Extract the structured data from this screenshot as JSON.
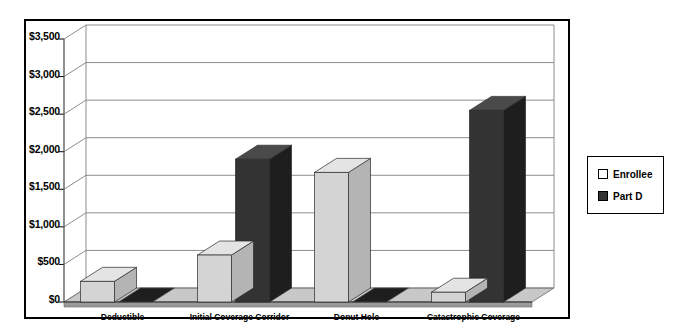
{
  "chart_data": {
    "type": "bar",
    "title": "",
    "subtitle": "",
    "xlabel": "",
    "ylabel": "",
    "categories": [
      "Deductible",
      "Initial Coverage Corridor",
      "Donut Hole",
      "Catastrophic Coverage"
    ],
    "series": [
      {
        "name": "Enrollee",
        "values": [
          275,
          625,
          1725,
          130
        ],
        "color": "#d4d4d4"
      },
      {
        "name": "Part D",
        "values": [
          0,
          1900,
          0,
          2550
        ],
        "color": "#333333"
      }
    ],
    "ylim": [
      0,
      3500
    ],
    "ytick_values": [
      0,
      500,
      1000,
      1500,
      2000,
      2500,
      3000,
      3500
    ],
    "ytick_labels": [
      "$0",
      "$500",
      "$1,000",
      "$1,500",
      "$2,000",
      "$2,500",
      "$3,000",
      "$3,500"
    ],
    "grid": true,
    "grid_axis": "y",
    "legend_position": "right",
    "style": "3d-clustered-column"
  },
  "legend": {
    "items": [
      {
        "label": "Enrollee",
        "swatch": "#ffffff"
      },
      {
        "label": "Part D",
        "swatch": "#333333"
      }
    ]
  },
  "colors": {
    "enrollee_front": "#d4d4d4",
    "enrollee_top": "#e4e4e4",
    "enrollee_side": "#b4b4b4",
    "partd_front": "#333333",
    "partd_top": "#4a4a4a",
    "partd_side": "#1e1e1e",
    "floor": "#9a9a9a",
    "grid": "#808080",
    "border": "#000000"
  }
}
